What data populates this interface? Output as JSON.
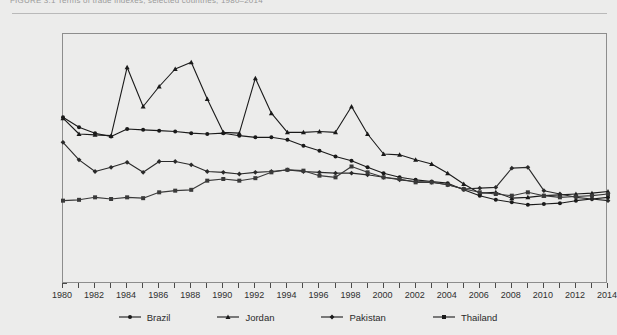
{
  "figure": {
    "caption": "FIGURE 3.1   Terms of trade indexes, selected countries, 1980–2014",
    "axis_label_y": "Terms of Trade (2005 = 100)",
    "axis_label_x": ""
  },
  "yaxis": {
    "ticks": [
      0,
      20,
      40,
      60,
      80,
      100,
      120,
      140,
      160,
      180,
      200,
      220,
      240,
      260,
      280,
      300
    ],
    "min": 0,
    "max": 300,
    "step": 20
  },
  "xaxis": {
    "labels": [
      "1980",
      "1982",
      "1984",
      "1986",
      "1988",
      "1990",
      "1992",
      "1994",
      "1996",
      "1998",
      "2000",
      "2002",
      "2004",
      "2006",
      "2008",
      "2010",
      "2012",
      "2014"
    ],
    "min": 1980,
    "max": 2014,
    "tick_step": 1,
    "label_step": 2
  },
  "legend": {
    "position": "bottom-center",
    "items": [
      {
        "label": "Brazil",
        "marker": "circle",
        "color": "#1a1a1a"
      },
      {
        "label": "Jordan",
        "marker": "triangle",
        "color": "#1a1a1a"
      },
      {
        "label": "Pakistan",
        "marker": "diamond",
        "color": "#1a1a1a"
      },
      {
        "label": "Thailand",
        "marker": "square",
        "color": "#1a1a1a"
      }
    ]
  },
  "chart_data": {
    "type": "line",
    "title": "Terms of trade indexes, selected countries, 1980–2014",
    "xlabel": "",
    "ylabel": "Terms of Trade (2005 = 100)",
    "xlim": [
      1980,
      2014
    ],
    "ylim": [
      0,
      300
    ],
    "grid": false,
    "legend_position": "bottom-center",
    "x": [
      1980,
      1981,
      1982,
      1983,
      1984,
      1985,
      1986,
      1987,
      1988,
      1989,
      1990,
      1991,
      1992,
      1993,
      1994,
      1995,
      1996,
      1997,
      1998,
      1999,
      2000,
      2001,
      2002,
      2003,
      2004,
      2005,
      2006,
      2007,
      2008,
      2009,
      2010,
      2011,
      2012,
      2013,
      2014
    ],
    "series": [
      {
        "name": "Brazil",
        "marker": "circle",
        "color": "#1a1a1a",
        "values": [
          200,
          188,
          181,
          177,
          186,
          185,
          184,
          183,
          181,
          180,
          181,
          178,
          176,
          176,
          173,
          166,
          160,
          153,
          148,
          140,
          133,
          128,
          125,
          123,
          121,
          113,
          106,
          101,
          98,
          95,
          96,
          97,
          100,
          102,
          104
        ]
      },
      {
        "name": "Jordan",
        "marker": "triangle",
        "color": "#1a1a1a",
        "values": [
          199,
          180,
          179,
          178,
          260,
          213,
          237,
          258,
          266,
          222,
          182,
          181,
          247,
          205,
          182,
          182,
          183,
          182,
          213,
          180,
          156,
          155,
          149,
          144,
          133,
          120,
          109,
          110,
          103,
          104,
          106,
          107,
          108,
          109,
          111
        ]
      },
      {
        "name": "Pakistan",
        "marker": "diamond",
        "color": "#2a2a2a",
        "values": [
          170,
          149,
          135,
          140,
          146,
          134,
          147,
          147,
          143,
          135,
          134,
          132,
          134,
          135,
          137,
          135,
          134,
          133,
          133,
          131,
          128,
          125,
          123,
          122,
          119,
          114,
          115,
          116,
          139,
          140,
          112,
          108,
          104,
          102,
          100
        ]
      },
      {
        "name": "Thailand",
        "marker": "square",
        "color": "#3a3a3a",
        "values": [
          100,
          101,
          104,
          102,
          104,
          103,
          110,
          112,
          113,
          124,
          126,
          124,
          127,
          134,
          137,
          136,
          130,
          128,
          141,
          134,
          128,
          126,
          122,
          122,
          119,
          114,
          110,
          108,
          106,
          110,
          106,
          104,
          105,
          106,
          108
        ]
      }
    ]
  }
}
